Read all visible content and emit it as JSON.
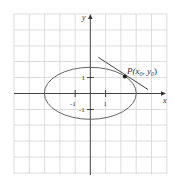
{
  "figure": {
    "type": "ellipse-with-tangent-line",
    "axes": {
      "x_label": "x",
      "y_label": "y"
    },
    "ticks": {
      "x": [
        {
          "value": -1,
          "label": "-1"
        },
        {
          "value": 1,
          "label": "1"
        }
      ],
      "y": [
        {
          "value": 1,
          "label": "1"
        },
        {
          "value": -1,
          "label": "-1"
        }
      ]
    },
    "point": {
      "label_main": "P(x",
      "sub0": "0",
      "sep": ", y",
      "sub1": "0",
      "close": ")"
    },
    "colors": {
      "grid": "#d0d0d0",
      "axis": "#444444",
      "curve": "#666666",
      "tangent": "#444444",
      "point": "#222222"
    }
  }
}
